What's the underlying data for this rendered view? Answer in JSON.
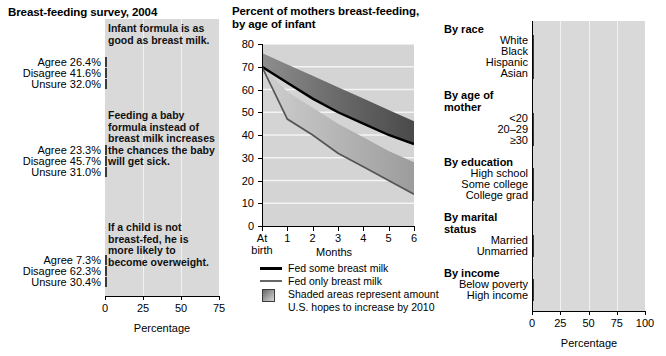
{
  "left": {
    "title": "Breast-feeding survey, 2004",
    "xlabel": "Percentage",
    "ticks": [
      "0",
      "25",
      "50",
      "75"
    ],
    "questions": [
      {
        "text": "Infant formula is as good as breast milk.",
        "rows": [
          {
            "label": "Agree 26.4%",
            "value": 26.4
          },
          {
            "label": "Disagree 41.6%",
            "value": 41.6
          },
          {
            "label": "Unsure 32.0%",
            "value": 32.0
          }
        ]
      },
      {
        "text": "Feeding a baby formula instead of breast milk increases the chances the baby will get sick.",
        "rows": [
          {
            "label": "Agree 23.3%",
            "value": 23.3
          },
          {
            "label": "Disagree 45.7%",
            "value": 45.7
          },
          {
            "label": "Unsure 31.0%",
            "value": 31.0
          }
        ]
      },
      {
        "text": "If a child is not breast-fed, he is more likely to become overweight.",
        "rows": [
          {
            "label": "Agree 7.3%",
            "value": 7.3
          },
          {
            "label": "Disagree 62.3%",
            "value": 62.3
          },
          {
            "label": "Unsure 30.4%",
            "value": 30.4
          }
        ]
      }
    ]
  },
  "middle": {
    "title": "Percent of mothers breast-feeding, by age of infant",
    "xlabel": "Months",
    "x_first_label_line1": "At",
    "x_first_label_line2": "birth",
    "xticks": [
      "At",
      "1",
      "2",
      "3",
      "4",
      "5",
      "6"
    ],
    "yticks": [
      "0",
      "10",
      "20",
      "30",
      "40",
      "50",
      "60",
      "70",
      "80"
    ],
    "legend": [
      {
        "kind": "line-thick",
        "text": "Fed some breast milk"
      },
      {
        "kind": "line-thin",
        "text": "Fed only breast milk"
      },
      {
        "kind": "swatch",
        "text": "Shaded areas represent amount"
      },
      {
        "kind": "cont",
        "text": "U.S. hopes to increase by 2010"
      }
    ]
  },
  "right": {
    "xlabel": "Percentage",
    "ticks": [
      "0",
      "25",
      "50",
      "75",
      "100"
    ],
    "groups": [
      {
        "heading": "By race",
        "heading_line2": "",
        "rows": [
          {
            "label": "White",
            "value": 70,
            "shade": "dark"
          },
          {
            "label": "Black",
            "value": 50,
            "shade": "mid"
          },
          {
            "label": "Hispanic",
            "value": 79,
            "shade": "lite"
          },
          {
            "label": "Asian",
            "value": 74,
            "shade": "dark"
          }
        ]
      },
      {
        "heading": "By age of",
        "heading_line2": "mother",
        "rows": [
          {
            "label": "<20",
            "value": 70,
            "shade": "dark"
          },
          {
            "label": "20–29",
            "value": 50,
            "shade": "mid"
          },
          {
            "label": "≥30",
            "value": 79,
            "shade": "lite"
          }
        ]
      },
      {
        "heading": "By education",
        "heading_line2": "",
        "rows": [
          {
            "label": "High school",
            "value": 70,
            "shade": "dark"
          },
          {
            "label": "Some college",
            "value": 50,
            "shade": "mid"
          },
          {
            "label": "College grad",
            "value": 79,
            "shade": "lite"
          }
        ]
      },
      {
        "heading": "By marital",
        "heading_line2": "status",
        "rows": [
          {
            "label": "Married",
            "value": 70,
            "shade": "dark"
          },
          {
            "label": "Unmarried",
            "value": 49,
            "shade": "mid"
          }
        ]
      },
      {
        "heading": "By income",
        "heading_line2": "",
        "rows": [
          {
            "label": "Below poverty",
            "value": 69,
            "shade": "dark"
          },
          {
            "label": "High income",
            "value": 50,
            "shade": "mid"
          }
        ]
      }
    ]
  },
  "chart_data": [
    {
      "type": "bar",
      "title": "Breast-feeding survey, 2004",
      "xlabel": "Percentage",
      "ylabel": "",
      "xlim": [
        0,
        75
      ],
      "grid": true,
      "orientation": "horizontal",
      "panels": [
        {
          "question": "Infant formula is as good as breast milk.",
          "categories": [
            "Agree",
            "Disagree",
            "Unsure"
          ],
          "values": [
            26.4,
            41.6,
            32.0
          ]
        },
        {
          "question": "Feeding a baby formula instead of breast milk increases the chances the baby will get sick.",
          "categories": [
            "Agree",
            "Disagree",
            "Unsure"
          ],
          "values": [
            23.3,
            45.7,
            31.0
          ]
        },
        {
          "question": "If a child is not breast-fed, he is more likely to become overweight.",
          "categories": [
            "Agree",
            "Disagree",
            "Unsure"
          ],
          "values": [
            7.3,
            62.3,
            30.4
          ]
        }
      ]
    },
    {
      "type": "line",
      "title": "Percent of mothers breast-feeding, by age of infant",
      "xlabel": "Months",
      "ylabel": "",
      "xlim": [
        0,
        6
      ],
      "ylim": [
        0,
        80
      ],
      "grid": true,
      "legend_position": "below",
      "x": [
        0,
        1,
        2,
        3,
        4,
        5,
        6
      ],
      "series": [
        {
          "name": "Fed some breast milk",
          "values": [
            70,
            63,
            56,
            50,
            45,
            40,
            36
          ]
        },
        {
          "name": "Fed only breast milk",
          "values": [
            70,
            47,
            40,
            32,
            26,
            20,
            14
          ]
        },
        {
          "name": "2010 goal: some breast milk (shaded upper bound)",
          "values": [
            76,
            71,
            66,
            61,
            56,
            51,
            46
          ]
        },
        {
          "name": "2010 goal: only breast milk (shaded upper bound)",
          "values": [
            70,
            59,
            52,
            45,
            39,
            33,
            28
          ]
        }
      ],
      "annotations": [
        "Shaded areas represent amount U.S. hopes to increase by 2010"
      ]
    },
    {
      "type": "bar",
      "title": "",
      "xlabel": "Percentage",
      "xlim": [
        0,
        100
      ],
      "grid": true,
      "orientation": "horizontal",
      "categories": [
        "White",
        "Black",
        "Hispanic",
        "Asian",
        "<20",
        "20–29",
        "≥30",
        "High school",
        "Some college",
        "College grad",
        "Married",
        "Unmarried",
        "Below poverty",
        "High income"
      ],
      "values": [
        70,
        50,
        79,
        74,
        70,
        50,
        79,
        70,
        50,
        79,
        70,
        49,
        69,
        50
      ],
      "groups": [
        "By race",
        "By age of mother",
        "By education",
        "By marital status",
        "By income"
      ]
    }
  ]
}
